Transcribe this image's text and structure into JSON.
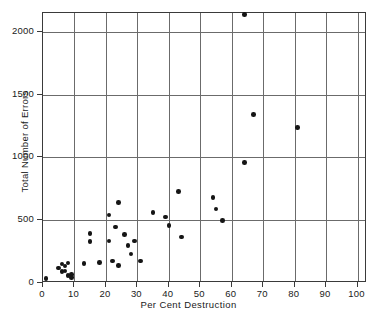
{
  "chart_data": {
    "type": "scatter",
    "title": "",
    "xlabel": "Per Cent Destruction",
    "ylabel": "Total Number of Errors",
    "xlim": [
      0,
      103
    ],
    "ylim": [
      0,
      2150
    ],
    "xticks": [
      0,
      10,
      20,
      30,
      40,
      50,
      60,
      70,
      80,
      90,
      100
    ],
    "yticks": [
      0,
      500,
      1000,
      1500,
      2000
    ],
    "xtick_labels": [
      "0",
      "10",
      "20",
      "30",
      "40",
      "50",
      "60",
      "70",
      "80",
      "90",
      "100"
    ],
    "ytick_labels": [
      "0",
      "500",
      "1000",
      "1500",
      "2000"
    ],
    "grid": true,
    "legend": "none",
    "marker": "filled-circle",
    "marker_color": "#151515",
    "points": [
      {
        "x": 1,
        "y": 35
      },
      {
        "x": 5,
        "y": 120
      },
      {
        "x": 6,
        "y": 150
      },
      {
        "x": 6,
        "y": 90
      },
      {
        "x": 7,
        "y": 135
      },
      {
        "x": 7,
        "y": 95
      },
      {
        "x": 8,
        "y": 160
      },
      {
        "x": 8,
        "y": 60
      },
      {
        "x": 9,
        "y": 70
      },
      {
        "x": 9,
        "y": 45
      },
      {
        "x": 13,
        "y": 155
      },
      {
        "x": 15,
        "y": 395
      },
      {
        "x": 15,
        "y": 330
      },
      {
        "x": 18,
        "y": 165
      },
      {
        "x": 21,
        "y": 540
      },
      {
        "x": 21,
        "y": 335
      },
      {
        "x": 22,
        "y": 175
      },
      {
        "x": 23,
        "y": 445
      },
      {
        "x": 24,
        "y": 640
      },
      {
        "x": 24,
        "y": 140
      },
      {
        "x": 26,
        "y": 385
      },
      {
        "x": 27,
        "y": 300
      },
      {
        "x": 28,
        "y": 230
      },
      {
        "x": 29,
        "y": 335
      },
      {
        "x": 31,
        "y": 175
      },
      {
        "x": 35,
        "y": 560
      },
      {
        "x": 39,
        "y": 525
      },
      {
        "x": 40,
        "y": 460
      },
      {
        "x": 43,
        "y": 730
      },
      {
        "x": 44,
        "y": 365
      },
      {
        "x": 54,
        "y": 680
      },
      {
        "x": 55,
        "y": 590
      },
      {
        "x": 57,
        "y": 500
      },
      {
        "x": 64,
        "y": 2140
      },
      {
        "x": 64,
        "y": 960
      },
      {
        "x": 67,
        "y": 1340
      },
      {
        "x": 81,
        "y": 1240
      }
    ]
  },
  "axis": {
    "x_label": "Per Cent Destruction",
    "y_label": "Total Number of Errors"
  }
}
